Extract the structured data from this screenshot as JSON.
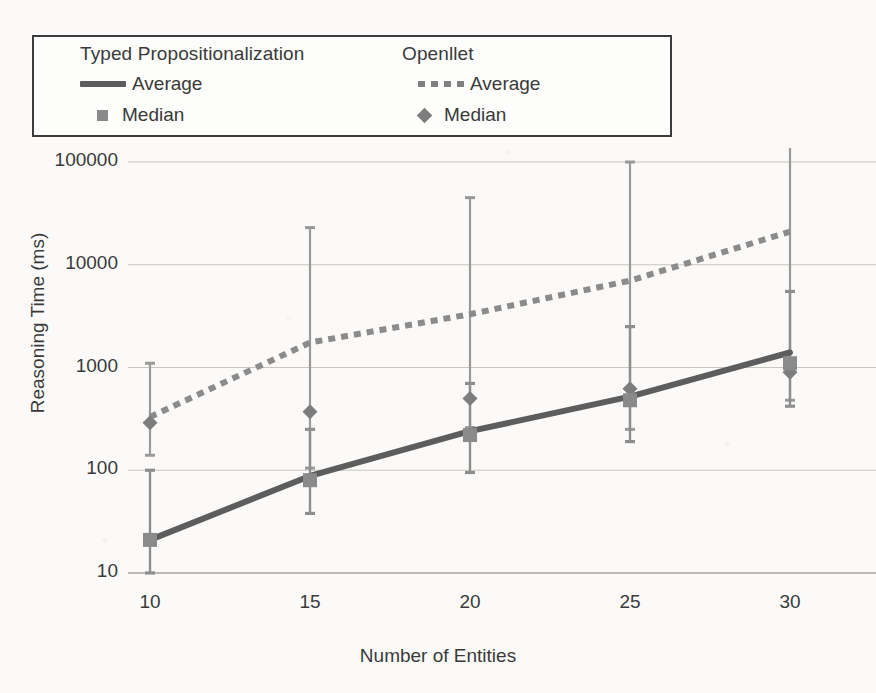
{
  "chart_data": {
    "type": "line",
    "title": "",
    "xlabel": "Number of Entities",
    "ylabel": "Reasoning Time (ms)",
    "x": [
      10,
      15,
      20,
      25,
      30
    ],
    "xtick_labels": [
      "10",
      "15",
      "20",
      "25",
      "30"
    ],
    "yscale": "log",
    "ylim": [
      10,
      100000
    ],
    "ytick_labels": [
      "10",
      "100",
      "1000",
      "10000",
      "100000"
    ],
    "ytick_values": [
      10,
      100,
      1000,
      10000,
      100000
    ],
    "grid": true,
    "legend_position": "top",
    "series": [
      {
        "name": "Typed Propositionalization Average",
        "group": "Typed Propositionalization",
        "stat": "Average",
        "style": "solid",
        "color": "#5d5d5d",
        "values": [
          21,
          88,
          240,
          520,
          1400
        ]
      },
      {
        "name": "Typed Propositionalization Median",
        "group": "Typed Propositionalization",
        "stat": "Median",
        "style": "square-marker",
        "color": "#8a8a8a",
        "values": [
          21,
          80,
          220,
          480,
          1100
        ],
        "error_low": [
          10,
          38,
          95,
          190,
          420
        ],
        "error_high": [
          100,
          250,
          700,
          2500,
          5500
        ]
      },
      {
        "name": "Openllet Average",
        "group": "Openllet",
        "stat": "Average",
        "style": "dashed",
        "color": "#8b8b8b",
        "values": [
          330,
          1750,
          3300,
          7000,
          21000
        ]
      },
      {
        "name": "Openllet Median",
        "group": "Openllet",
        "stat": "Median",
        "style": "diamond-marker",
        "color": "#7d7d7d",
        "values": [
          290,
          370,
          500,
          620,
          900
        ],
        "error_low": [
          140,
          105,
          260,
          250,
          480
        ],
        "error_high": [
          1100,
          23000,
          45000,
          100000,
          200000
        ]
      }
    ]
  },
  "legend": {
    "columns": [
      {
        "title": "Typed Propositionalization",
        "rows": [
          {
            "marker": "line-solid",
            "label": "Average"
          },
          {
            "marker": "square",
            "label": "Median"
          }
        ]
      },
      {
        "title": "Openllet",
        "rows": [
          {
            "marker": "line-dashed",
            "label": "Average"
          },
          {
            "marker": "diamond",
            "label": "Median"
          }
        ]
      }
    ]
  },
  "axes": {
    "y": {
      "title": "Reasoning Time (ms)",
      "ticks": [
        "100000",
        "10000",
        "1000",
        "100",
        "10"
      ]
    },
    "x": {
      "title": "Number of Entities",
      "ticks": [
        "10",
        "15",
        "20",
        "25",
        "30"
      ]
    }
  }
}
